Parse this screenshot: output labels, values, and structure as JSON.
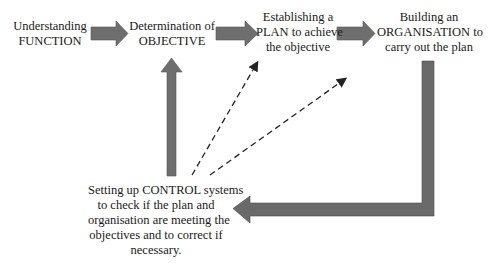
{
  "diagram": {
    "type": "process-flow",
    "nodes": [
      {
        "id": "function",
        "lines": [
          "Understanding",
          "FUNCTION"
        ]
      },
      {
        "id": "objective",
        "lines": [
          "Determination of",
          "OBJECTIVE"
        ]
      },
      {
        "id": "plan",
        "lines": [
          "Establishing a",
          "PLAN to achieve",
          "the objective"
        ]
      },
      {
        "id": "organisation",
        "lines": [
          "Building an",
          "ORGANISATION to",
          "carry out the plan"
        ]
      },
      {
        "id": "control",
        "lines": [
          "Setting up CONTROL systems",
          "to check if the plan and",
          "organisation are meeting the",
          "objectives and to correct if",
          "necessary."
        ]
      }
    ],
    "edges": [
      {
        "from": "function",
        "to": "objective",
        "style": "solid-thick"
      },
      {
        "from": "objective",
        "to": "plan",
        "style": "solid-thick"
      },
      {
        "from": "plan",
        "to": "organisation",
        "style": "solid-thick"
      },
      {
        "from": "organisation",
        "to": "control",
        "style": "solid-thick-elbow"
      },
      {
        "from": "control",
        "to": "objective",
        "style": "solid-thick"
      },
      {
        "from": "control",
        "to": "plan",
        "style": "dashed"
      },
      {
        "from": "control",
        "to": "organisation",
        "style": "dashed"
      }
    ],
    "colors": {
      "arrow_fill": "#6e6e6e",
      "arrow_dark": "#4a4a4a",
      "text": "#1a1a1a",
      "background": "#ffffff"
    }
  }
}
